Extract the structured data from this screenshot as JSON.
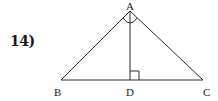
{
  "problem": {
    "number": "14)"
  },
  "diagram": {
    "type": "triangle-with-altitude",
    "vertices": {
      "A": {
        "label": "A",
        "x": 130,
        "y": 11
      },
      "B": {
        "label": "B",
        "x": 61,
        "y": 80
      },
      "C": {
        "label": "C",
        "x": 203,
        "y": 80
      },
      "D": {
        "label": "D",
        "x": 130,
        "y": 80
      }
    },
    "segments": [
      "AB",
      "AC",
      "BC",
      "AD"
    ],
    "marks": {
      "right_angle_at": "D",
      "angle_arcs_at": "A",
      "note": "AD bisects angle A (two arcs at A)"
    },
    "stroke_color": "#2a2a2a"
  }
}
